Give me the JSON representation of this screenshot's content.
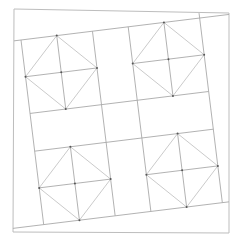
{
  "diagram": {
    "colors": {
      "background": "#ffffff",
      "frame": "#bdbdbd",
      "grid": "#a9a9a9",
      "diamond": "#c4c4c4",
      "vertex": "#555555"
    },
    "frame": {
      "points": [
        [
          14,
          9
        ],
        [
          229,
          13
        ],
        [
          229,
          233
        ],
        [
          13,
          232
        ]
      ]
    },
    "grid": {
      "origin": [
        21,
        40
      ],
      "rotation_deg": -7,
      "unit_u": [
        0.9925,
        -0.122
      ],
      "unit_v": [
        0.122,
        0.9925
      ],
      "block_size": 72,
      "block_height": 74,
      "vertical_lines_x": [
        0,
        72,
        108,
        180
      ],
      "horizontal_lines_y": [
        0,
        74,
        112,
        186
      ],
      "extended_top": [
        -7,
        209.6
      ],
      "extended_bottom": [
        -31,
        186.7
      ],
      "extended_right_top": -5
    },
    "blocks": [
      {
        "name": "top-left",
        "x": 0,
        "y": 0
      },
      {
        "name": "top-right",
        "x": 108,
        "y": 0
      },
      {
        "name": "bottom-left",
        "x": 0,
        "y": 112
      },
      {
        "name": "bottom-right",
        "x": 108,
        "y": 112
      }
    ]
  }
}
